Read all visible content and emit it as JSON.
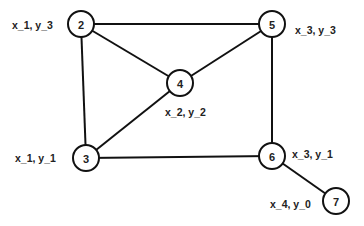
{
  "diagram": {
    "type": "graph",
    "nodes": [
      {
        "id": "2",
        "label": "2",
        "cx": 81,
        "cy": 24,
        "coord_label": "x_1, y_3",
        "lx": 12,
        "ly": 25
      },
      {
        "id": "5",
        "label": "5",
        "cx": 272,
        "cy": 24,
        "coord_label": "x_3, y_3",
        "lx": 295,
        "ly": 30
      },
      {
        "id": "4",
        "label": "4",
        "cx": 180,
        "cy": 83,
        "coord_label": "x_2, y_2",
        "lx": 165,
        "ly": 112
      },
      {
        "id": "3",
        "label": "3",
        "cx": 86,
        "cy": 158,
        "coord_label": "x_1, y_1",
        "lx": 15,
        "ly": 158
      },
      {
        "id": "6",
        "label": "6",
        "cx": 272,
        "cy": 156,
        "coord_label": "x_3, y_1",
        "lx": 292,
        "ly": 154
      },
      {
        "id": "7",
        "label": "7",
        "cx": 336,
        "cy": 201,
        "coord_label": "x_4, y_0",
        "lx": 270,
        "ly": 204
      }
    ],
    "edges": [
      {
        "from": "2",
        "to": "5"
      },
      {
        "from": "2",
        "to": "4"
      },
      {
        "from": "2",
        "to": "3"
      },
      {
        "from": "4",
        "to": "5"
      },
      {
        "from": "4",
        "to": "3"
      },
      {
        "from": "3",
        "to": "6"
      },
      {
        "from": "5",
        "to": "6"
      },
      {
        "from": "6",
        "to": "7"
      }
    ],
    "node_radius": 13
  }
}
